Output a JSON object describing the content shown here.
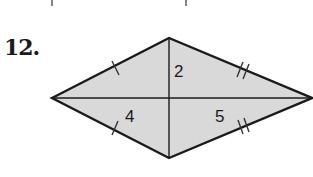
{
  "problem": {
    "number": "12."
  },
  "diagram": {
    "shape": "kite",
    "fill_color": "#d9d9d9",
    "stroke_color": "#1a1a1a",
    "vertices": {
      "left": [
        52,
        98
      ],
      "top": [
        169,
        38
      ],
      "right": [
        312,
        98
      ],
      "bottom": [
        169,
        158
      ]
    },
    "labels": {
      "upper_segment": "2",
      "left_segment": "4",
      "right_segment": "5"
    },
    "congruence_marks": {
      "left_sides": "single tick",
      "right_sides": "double tick"
    }
  }
}
